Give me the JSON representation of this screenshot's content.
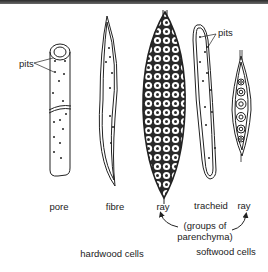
{
  "diagram": {
    "callouts": {
      "pits_left": "pits",
      "pits_right": "pits"
    },
    "cell_labels": {
      "pore": "pore",
      "fibre": "fibre",
      "ray_hardwood": "ray",
      "tracheid": "tracheid",
      "ray_softwood": "ray"
    },
    "annotation": {
      "line1": "(groups of",
      "line2": "parenchyma)"
    },
    "group_labels": {
      "hardwood": "hardwood cells",
      "softwood": "softwood cells"
    },
    "colors": {
      "ink": "#222222",
      "background": "#ffffff"
    }
  }
}
